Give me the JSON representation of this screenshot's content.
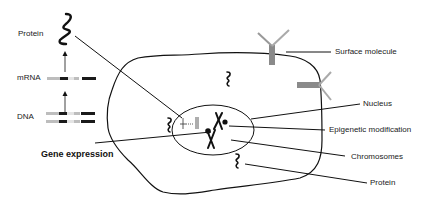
{
  "diagram": {
    "type": "cell-gene-expression-schematic",
    "left_panel": {
      "labels": {
        "protein": "Protein",
        "mrna": "mRNA",
        "dna": "DNA",
        "gene_expression": "Gene expression"
      },
      "flow": [
        "DNA",
        "mRNA",
        "Protein"
      ]
    },
    "callouts": {
      "surface_molecule": "Surface molecule",
      "nucleus": "Nucleus",
      "epigenetic_modification": "Epigenetic modification",
      "chromosomes": "Chromosomes",
      "protein": "Protein"
    },
    "colors": {
      "line": "#111111",
      "receptor": "#8a8a8a",
      "gene_dark": "#1a1a1a",
      "gene_light": "#bdbdbd"
    }
  }
}
